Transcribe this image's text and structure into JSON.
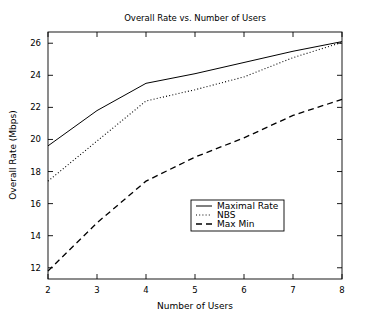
{
  "chart_data": {
    "type": "line",
    "title": "Overall Rate vs. Number of Users",
    "xlabel": "Number of Users",
    "ylabel": "Overall Rate (Mbps)",
    "xlim": [
      2,
      8
    ],
    "ylim": [
      11.3,
      26.7
    ],
    "xticks": [
      2,
      3,
      4,
      5,
      6,
      7,
      8
    ],
    "yticks": [
      12,
      14,
      16,
      18,
      20,
      22,
      24,
      26
    ],
    "xtick_labels": [
      "2",
      "3",
      "4",
      "5",
      "6",
      "7",
      "8"
    ],
    "ytick_labels": [
      "12",
      "14",
      "16",
      "18",
      "20",
      "22",
      "24",
      "26"
    ],
    "grid": false,
    "legend_position": "center-right",
    "x": [
      2,
      3,
      4,
      5,
      6,
      7,
      8
    ],
    "series": [
      {
        "name": "Maximal Rate",
        "style": "solid",
        "color": "#000000",
        "values": [
          19.6,
          21.8,
          23.5,
          24.1,
          24.8,
          25.5,
          26.1
        ]
      },
      {
        "name": "NBS",
        "style": "dotted",
        "color": "#000000",
        "values": [
          17.4,
          19.9,
          22.4,
          23.1,
          23.9,
          25.1,
          26.05
        ]
      },
      {
        "name": "Max Min",
        "style": "dashed",
        "color": "#000000",
        "values": [
          11.8,
          14.8,
          17.4,
          18.9,
          20.1,
          21.5,
          22.5
        ]
      }
    ]
  },
  "legend": {
    "items": [
      {
        "label": "Maximal Rate",
        "style": "solid"
      },
      {
        "label": "NBS",
        "style": "dotted"
      },
      {
        "label": "Max Min",
        "style": "dashed"
      }
    ]
  }
}
